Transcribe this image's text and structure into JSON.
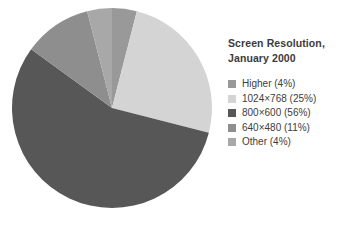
{
  "chart_data": {
    "type": "pie",
    "title": "Screen Resolution, January 2000",
    "title_lines": [
      "Screen Resolution,",
      "January 2000"
    ],
    "categories": [
      "Higher",
      "1024×768",
      "800×600",
      "640×480",
      "Other"
    ],
    "values": [
      4,
      25,
      56,
      11,
      4
    ],
    "value_unit": "%",
    "legend_position": "right",
    "grid": false,
    "slices": [
      {
        "label": "Higher",
        "percent": 4,
        "legend_text": "Higher (4%)",
        "color": "#999999",
        "start_angle": 0,
        "end_angle": 14.4
      },
      {
        "label": "1024×768",
        "percent": 25,
        "legend_text": "1024×768 (25%)",
        "color": "#d4d4d4",
        "start_angle": 14.4,
        "end_angle": 104.4
      },
      {
        "label": "800×600",
        "percent": 56,
        "legend_text": "800×600 (56%)",
        "color": "#575757",
        "start_angle": 104.4,
        "end_angle": 306.0
      },
      {
        "label": "640×480",
        "percent": 11,
        "legend_text": "640×480 (11%)",
        "color": "#8e8e8e",
        "start_angle": 306.0,
        "end_angle": 345.6
      },
      {
        "label": "Other",
        "percent": 4,
        "legend_text": "Other (4%)",
        "color": "#a8a8a8",
        "start_angle": 345.6,
        "end_angle": 360.0
      }
    ]
  },
  "legend": {
    "title_line_1": "Screen Resolution,",
    "title_line_2": "January 2000",
    "items": [
      {
        "label": "Higher (4%)",
        "color": "#999999"
      },
      {
        "label": "1024×768 (25%)",
        "color": "#d4d4d4"
      },
      {
        "label": "800×600 (56%)",
        "color": "#575757"
      },
      {
        "label": "640×480 (11%)",
        "color": "#8e8e8e"
      },
      {
        "label": "Other (4%)",
        "color": "#a8a8a8"
      }
    ]
  },
  "colors": {
    "background": "#ffffff",
    "text": "#3d3d3d",
    "title_text": "#3b3b3b"
  }
}
